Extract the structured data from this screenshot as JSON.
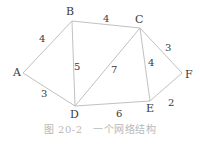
{
  "diagram": {
    "type": "weighted-undirected-graph",
    "nodes": [
      {
        "id": "A",
        "label": "A",
        "x": 23,
        "y": 73,
        "lx": 13,
        "ly": 76
      },
      {
        "id": "B",
        "label": "B",
        "x": 72,
        "y": 21,
        "lx": 66,
        "ly": 15
      },
      {
        "id": "C",
        "label": "C",
        "x": 140,
        "y": 28,
        "lx": 135,
        "ly": 23
      },
      {
        "id": "D",
        "label": "D",
        "x": 75,
        "y": 106,
        "lx": 70,
        "ly": 118
      },
      {
        "id": "E",
        "label": "E",
        "x": 150,
        "y": 101,
        "lx": 146,
        "ly": 112
      },
      {
        "id": "F",
        "label": "F",
        "x": 182,
        "y": 73,
        "lx": 185,
        "ly": 78
      }
    ],
    "edges": [
      {
        "from": "A",
        "to": "B",
        "weight": "4",
        "lx": 39,
        "ly": 42
      },
      {
        "from": "A",
        "to": "D",
        "weight": "3",
        "lx": 41,
        "ly": 97
      },
      {
        "from": "B",
        "to": "C",
        "weight": "4",
        "lx": 103,
        "ly": 22
      },
      {
        "from": "B",
        "to": "D",
        "weight": "5",
        "lx": 74,
        "ly": 70
      },
      {
        "from": "C",
        "to": "D",
        "weight": "7",
        "lx": 111,
        "ly": 73
      },
      {
        "from": "C",
        "to": "E",
        "weight": "4",
        "lx": 148,
        "ly": 66
      },
      {
        "from": "C",
        "to": "F",
        "weight": "3",
        "lx": 165,
        "ly": 51
      },
      {
        "from": "D",
        "to": "E",
        "weight": "6",
        "lx": 116,
        "ly": 117
      },
      {
        "from": "E",
        "to": "F",
        "weight": "2",
        "lx": 168,
        "ly": 106
      }
    ]
  },
  "caption": "图 20-2　一个网络结构",
  "colors": {
    "edge": "#b9b9b9",
    "label": "#3a3a3a",
    "caption": "#b8b8b8"
  }
}
